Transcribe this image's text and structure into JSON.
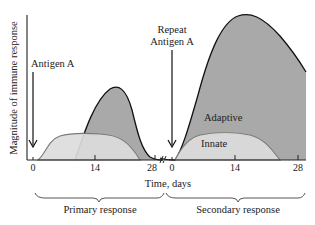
{
  "diagram": {
    "y_axis_label": "Magnitude of immune response",
    "x_axis_label": "Time, days",
    "annotations": {
      "primary_antigen": "Antigen A",
      "repeat_antigen_line1": "Repeat",
      "repeat_antigen_line2": "Antigen A",
      "adaptive": "Adaptive",
      "innate": "Innate"
    },
    "primary_ticks": [
      "0",
      "14",
      "28"
    ],
    "secondary_ticks": [
      "0",
      "14",
      "28"
    ],
    "brackets": {
      "primary": "Primary response",
      "secondary": "Secondary response"
    },
    "colors": {
      "adaptive_fill": "#a9a9a9",
      "innate_fill": "#dcdcdc",
      "innate_stroke": "#7a7a7a",
      "adaptive_stroke": "#111111"
    }
  }
}
